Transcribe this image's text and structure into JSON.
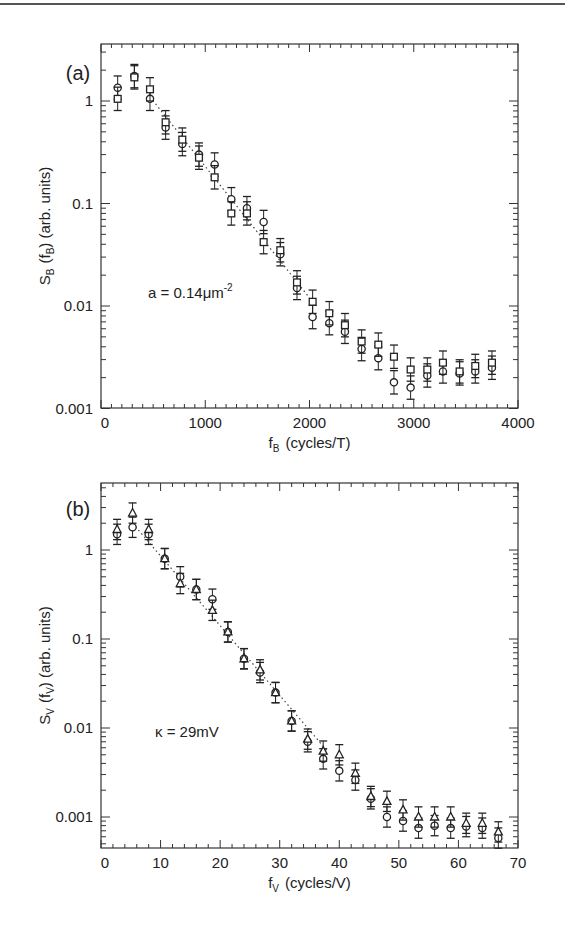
{
  "chart_data": [
    {
      "panel_label": "(a)",
      "type": "scatter",
      "title": "",
      "xlabel": "f_B (cycles/T)",
      "xlabel_main": "f",
      "xlabel_sub": "B",
      "xlabel_rest": "(cycles/T)",
      "ylabel": "S_B (f_B) (arb. units)",
      "ylabel_main": "S",
      "ylabel_sub": "B",
      "ylabel_mid": "(f",
      "ylabel_sub2": "B",
      "ylabel_rest": ") (arb. units)",
      "yscale": "log",
      "xlim": [
        0,
        4000
      ],
      "ylim": [
        0.001,
        5
      ],
      "xticks": [
        "0",
        "1000",
        "2000",
        "3000",
        "4000"
      ],
      "yticks": [
        "0.001",
        "0.01",
        "0.1",
        "1"
      ],
      "annotation": "a = 0.14μm",
      "annotation_sup": "-2",
      "grid": false,
      "series": [
        {
          "name": "circles",
          "marker": "circle",
          "x": [
            160,
            320,
            470,
            620,
            780,
            940,
            1090,
            1250,
            1400,
            1560,
            1720,
            1880,
            2030,
            2190,
            2340,
            2500,
            2660,
            2810,
            2970,
            3130,
            3280,
            3440,
            3590,
            3750
          ],
          "y": [
            1.35,
            1.75,
            1.05,
            0.55,
            0.38,
            0.3,
            0.24,
            0.11,
            0.09,
            0.066,
            0.032,
            0.015,
            0.0078,
            0.0068,
            0.0056,
            0.0038,
            0.0031,
            0.0018,
            0.0016,
            0.0021,
            0.0023,
            0.0022,
            0.0023,
            0.0025
          ]
        },
        {
          "name": "squares",
          "marker": "square",
          "x": [
            160,
            320,
            470,
            620,
            780,
            940,
            1090,
            1250,
            1400,
            1560,
            1720,
            1880,
            2030,
            2190,
            2340,
            2500,
            2660,
            2810,
            2970,
            3130,
            3280,
            3440,
            3590,
            3750
          ],
          "y": [
            1.05,
            1.7,
            1.3,
            0.62,
            0.42,
            0.28,
            0.18,
            0.08,
            0.08,
            0.042,
            0.035,
            0.017,
            0.011,
            0.0085,
            0.0065,
            0.0045,
            0.0042,
            0.0032,
            0.0024,
            0.0024,
            0.0028,
            0.0023,
            0.0026,
            0.0028
          ]
        }
      ],
      "fit_line": {
        "style": "dotted",
        "x": [
          470,
          2000
        ],
        "y": [
          1.1,
          0.012
        ]
      }
    },
    {
      "panel_label": "(b)",
      "type": "scatter",
      "title": "",
      "xlabel": "f_V (cycles/V)",
      "xlabel_main": "f",
      "xlabel_sub": "V",
      "xlabel_rest": "(cycles/V)",
      "ylabel": "S_V (f_V) (arb. units)",
      "ylabel_main": "S",
      "ylabel_sub": "V",
      "ylabel_mid": "(f",
      "ylabel_sub2": "V",
      "ylabel_rest": ") (arb. units)",
      "yscale": "log",
      "xlim": [
        0,
        70
      ],
      "ylim": [
        0.0004,
        5.6
      ],
      "xticks": [
        "0",
        "10",
        "20",
        "30",
        "40",
        "50",
        "60",
        "70"
      ],
      "yticks": [
        "0.001",
        "0.01",
        "0.1",
        "1"
      ],
      "annotation": "κ = 29mV",
      "annotation_sup": "",
      "grid": false,
      "series": [
        {
          "name": "circles",
          "marker": "circle",
          "x": [
            2.7,
            5.3,
            8,
            10.7,
            13.3,
            16,
            18.7,
            21.3,
            24,
            26.7,
            29.3,
            32,
            34.7,
            37.3,
            40,
            42.7,
            45.3,
            48,
            50.7,
            53.3,
            56,
            58.7,
            61.3,
            64,
            66.7
          ],
          "y": [
            1.5,
            1.8,
            1.5,
            0.8,
            0.5,
            0.36,
            0.28,
            0.12,
            0.06,
            0.042,
            0.025,
            0.012,
            0.007,
            0.0045,
            0.0033,
            0.0026,
            0.0016,
            0.001,
            0.0009,
            0.00075,
            0.0008,
            0.00075,
            0.00078,
            0.00075,
            0.00058
          ]
        },
        {
          "name": "triangles",
          "marker": "triangle",
          "x": [
            2.7,
            5.3,
            8,
            10.7,
            13.3,
            16,
            18.7,
            21.3,
            24,
            26.7,
            29.3,
            32,
            34.7,
            37.3,
            40,
            42.7,
            45.3,
            48,
            50.7,
            53.3,
            56,
            58.7,
            61.3,
            64,
            66.7
          ],
          "y": [
            1.7,
            2.6,
            1.7,
            0.8,
            0.42,
            0.36,
            0.21,
            0.12,
            0.06,
            0.045,
            0.025,
            0.012,
            0.0075,
            0.0055,
            0.005,
            0.0031,
            0.0017,
            0.0015,
            0.0012,
            0.001,
            0.001,
            0.001,
            0.00085,
            0.00085,
            0.00068
          ]
        }
      ],
      "fit_line": {
        "style": "dotted",
        "x": [
          5.3,
          38
        ],
        "y": [
          2.0,
          0.0055
        ]
      }
    }
  ]
}
